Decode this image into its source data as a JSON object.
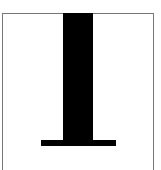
{
  "glyph": {
    "character": "I",
    "icon": "text-cursor-glyph-icon",
    "color": "#000000"
  },
  "frame": {
    "border_color": "#777777"
  }
}
